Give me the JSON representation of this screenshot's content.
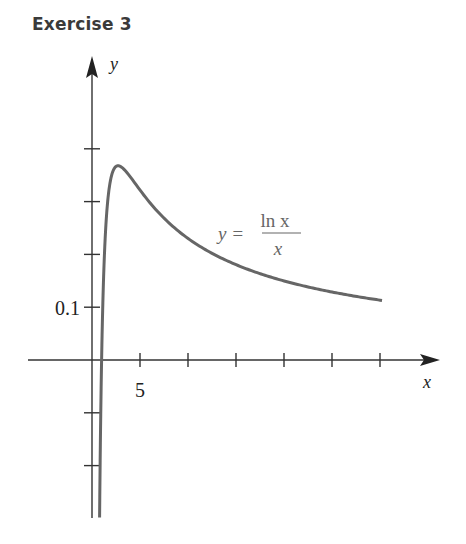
{
  "header": {
    "title": "Exercise 3"
  },
  "chart_data": {
    "type": "line",
    "title": "Exercise 3",
    "function": "y = ln x / x",
    "xlabel": "x",
    "ylabel": "y",
    "x_tick_labels": [
      {
        "value": 5,
        "label": "5"
      }
    ],
    "y_tick_labels": [
      {
        "value": 0.1,
        "label": "0.1"
      }
    ],
    "x_ticks": [
      5,
      10,
      15,
      20,
      25,
      30
    ],
    "y_ticks": [
      -0.2,
      -0.1,
      0.1,
      0.2,
      0.3,
      0.4
    ],
    "xlim": [
      -7,
      36
    ],
    "ylim": [
      -0.3,
      0.55
    ],
    "grid": false,
    "annotation": {
      "lhs": "y =",
      "numerator": "ln x",
      "denominator": "x"
    },
    "series": [
      {
        "name": "y = ln x / x",
        "x": [
          0.8,
          1,
          1.5,
          2,
          2.718,
          4,
          6,
          8,
          10,
          15,
          20,
          25,
          30
        ],
        "y": [
          -0.279,
          0,
          0.27,
          0.347,
          0.368,
          0.347,
          0.299,
          0.26,
          0.23,
          0.181,
          0.15,
          0.129,
          0.113
        ]
      }
    ],
    "peak": {
      "x": 2.718,
      "y": 0.368
    }
  }
}
